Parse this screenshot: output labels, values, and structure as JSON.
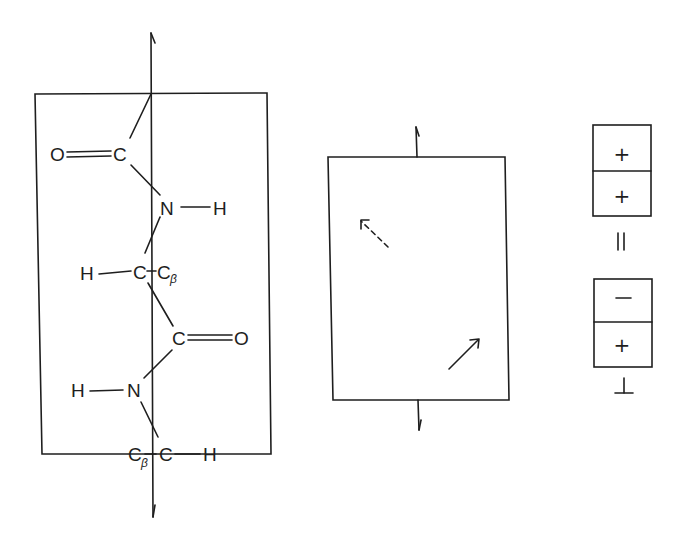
{
  "figure": {
    "left_panel": {
      "name": "peptide-backbone-structure",
      "atoms": {
        "o1": "O",
        "c1": "C",
        "n1": "N",
        "h1": "H",
        "h2": "H",
        "ca1": "C",
        "cb1": "C",
        "cb1_sub": "β",
        "c2": "C",
        "o2": "O",
        "h3": "H",
        "n2": "N",
        "cb2": "C",
        "cb2_sub": "β",
        "ca2": "C",
        "h4": "H"
      }
    },
    "middle_panel": {
      "name": "transition-moment-box",
      "arrows": [
        "dashed-arrow-up-left",
        "solid-arrow-up-right"
      ]
    },
    "right_panel": {
      "parallel_stack": {
        "top": "+",
        "bottom": "+",
        "label": "||"
      },
      "perpendicular_stack": {
        "top": "−",
        "bottom": "+",
        "label": "⊥"
      }
    },
    "colors": {
      "ink": "#1e1e1e",
      "background": "#ffffff"
    }
  }
}
